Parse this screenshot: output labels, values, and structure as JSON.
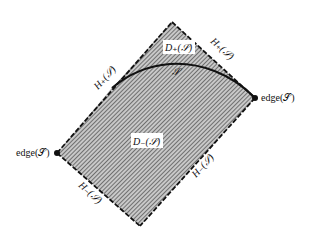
{
  "figure": {
    "type": "causal-domain-diagram",
    "colors": {
      "background": "#ffffff",
      "hatch": "#555555",
      "hatch_bg": "#bdbdbd",
      "edge": "#111111"
    },
    "vertices": {
      "top": [
        172,
        22
      ],
      "left": [
        57,
        153
      ],
      "right": [
        255,
        98
      ],
      "bottom": [
        140,
        226
      ]
    },
    "labels": {
      "edge_left": "edge(𝒮)",
      "edge_right": "edge(𝒮)",
      "h_plus_left": "H₊(𝒮)",
      "h_plus_right": "H₊(𝒮)",
      "h_minus_left": "H₋(𝒮)",
      "h_minus_right": "H₋(𝒮)",
      "d_plus": "D₊(𝒮)",
      "d_minus": "D₋(𝒮)",
      "surface": "𝒮"
    }
  }
}
